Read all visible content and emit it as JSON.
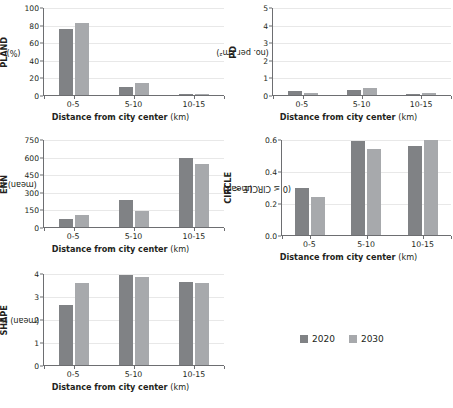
{
  "figure": {
    "xlabel_bold": "Distance from city center",
    "xlabel_unit": "(km)",
    "categories": [
      "0-5",
      "5-10",
      "10-15"
    ],
    "series_names": [
      "2020",
      "2030"
    ],
    "colors": {
      "s2020": "#808285",
      "s2030": "#a7a9ac",
      "axis": "#6d6e71",
      "grid": "#e8e8e8",
      "text": "#231f20"
    }
  },
  "legend": {
    "position": "center-right",
    "entries": [
      {
        "label": "2020",
        "color": "#808285"
      },
      {
        "label": "2030",
        "color": "#a7a9ac"
      }
    ]
  },
  "chart_data": [
    {
      "type": "bar",
      "id": "pland",
      "title": "",
      "ylabel_bold": "PLAND",
      "ylabel_thin": "(%)",
      "ylabel_line2": "",
      "xlabel": "Distance from city center (km)",
      "categories": [
        "0-5",
        "5-10",
        "10-15"
      ],
      "series": [
        {
          "name": "2020",
          "values": [
            75,
            9.5,
            1.2
          ]
        },
        {
          "name": "2030",
          "values": [
            81.5,
            14,
            1.5
          ]
        }
      ],
      "ylim": [
        0,
        100
      ],
      "yticks": [
        0,
        20,
        40,
        60,
        80,
        100
      ],
      "yticklabels": [
        "0",
        "20",
        "40",
        "60",
        "80",
        "100"
      ],
      "grid": true
    },
    {
      "type": "bar",
      "id": "pd",
      "title": "",
      "ylabel_bold": "PD",
      "ylabel_thin": "(no. per km²)",
      "ylabel_line2": "",
      "xlabel": "Distance from city center (km)",
      "categories": [
        "0-5",
        "5-10",
        "10-15"
      ],
      "series": [
        {
          "name": "2020",
          "values": [
            0.2,
            0.3,
            0.05
          ]
        },
        {
          "name": "2030",
          "values": [
            0.1,
            0.4,
            0.1
          ]
        }
      ],
      "ylim": [
        0,
        5
      ],
      "yticks": [
        0,
        1,
        2,
        3,
        4,
        5
      ],
      "yticklabels": [
        "0",
        "1",
        "2",
        "3",
        "4",
        "5"
      ],
      "grid": true
    },
    {
      "type": "bar",
      "id": "enn",
      "title": "",
      "ylabel_bold": "ENN",
      "ylabel_thin": "(mean) (m)",
      "ylabel_line2": "",
      "xlabel": "Distance from city center (km)",
      "categories": [
        "0-5",
        "5-10",
        "10-15"
      ],
      "series": [
        {
          "name": "2020",
          "values": [
            72,
            226,
            590
          ]
        },
        {
          "name": "2030",
          "values": [
            102,
            133,
            535
          ]
        }
      ],
      "ylim": [
        0,
        750
      ],
      "yticks": [
        0,
        150,
        300,
        450,
        600,
        750
      ],
      "yticklabels": [
        "0",
        "150",
        "300",
        "450",
        "600",
        "750"
      ],
      "grid": true
    },
    {
      "type": "bar",
      "id": "circle",
      "title": "",
      "ylabel_bold": "CIRCLE",
      "ylabel_thin": "(mean)",
      "ylabel_line2": "(0 ≤ CIRCLE < 1)",
      "xlabel": "Distance from city center (km)",
      "categories": [
        "0-5",
        "5-10",
        "10-15"
      ],
      "series": [
        {
          "name": "2020",
          "values": [
            0.295,
            0.585,
            0.555
          ]
        },
        {
          "name": "2030",
          "values": [
            0.24,
            0.535,
            0.595
          ]
        }
      ],
      "ylim": [
        0,
        0.6
      ],
      "yticks": [
        0,
        0.2,
        0.4,
        0.6
      ],
      "yticklabels": [
        "0.0",
        "0.2",
        "0.4",
        "0.6"
      ],
      "grid": true
    },
    {
      "type": "bar",
      "id": "shape",
      "title": "",
      "ylabel_bold": "SHAPE",
      "ylabel_thin": "(mean) (≥ 1)",
      "ylabel_line2": "",
      "xlabel": "Distance from city center (km)",
      "categories": [
        "0-5",
        "5-10",
        "10-15"
      ],
      "series": [
        {
          "name": "2020",
          "values": [
            2.6,
            3.9,
            3.62
          ]
        },
        {
          "name": "2030",
          "values": [
            3.55,
            3.82,
            3.57
          ]
        }
      ],
      "ylim": [
        0,
        4
      ],
      "yticks": [
        0,
        1,
        2,
        3,
        4
      ],
      "yticklabels": [
        "0",
        "1",
        "2",
        "3",
        "4"
      ],
      "grid": true
    }
  ]
}
